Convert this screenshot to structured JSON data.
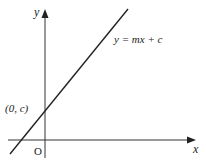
{
  "diagram": {
    "type": "cartesian-line-graph",
    "axes": {
      "x_label": "x",
      "y_label": "y",
      "origin_label": "O"
    },
    "line": {
      "equation": "y = mx + c",
      "y_intercept_label": "(0, c)"
    }
  }
}
